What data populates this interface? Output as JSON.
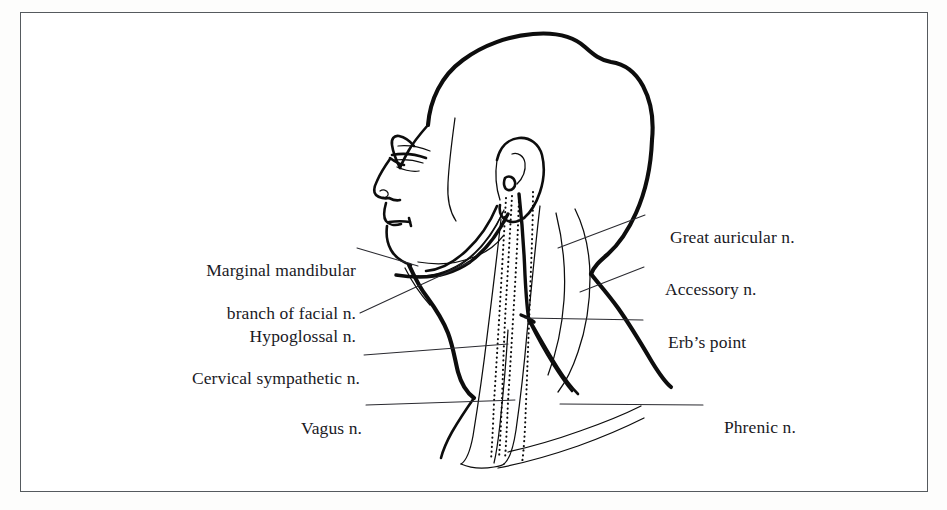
{
  "figure": {
    "frame_border_color": "#555a5e",
    "ink_color": "#0d0d0d",
    "background_color": "#ffffff"
  },
  "labels": {
    "left": [
      {
        "id": "marginal-mandibular",
        "line1": "Marginal mandibular",
        "line2": "branch of facial n.",
        "text": "Marginal mandibular branch of facial n."
      },
      {
        "id": "hypoglossal",
        "line1": "Hypoglossal n.",
        "text": "Hypoglossal n."
      },
      {
        "id": "cervical-sympathetic",
        "line1": "Cervical sympathetic n.",
        "text": "Cervical sympathetic n."
      },
      {
        "id": "vagus",
        "line1": "Vagus n.",
        "text": "Vagus n."
      }
    ],
    "right": [
      {
        "id": "great-auricular",
        "line1": "Great auricular n.",
        "text": "Great auricular n."
      },
      {
        "id": "accessory",
        "line1": "Accessory n.",
        "text": "Accessory n."
      },
      {
        "id": "erbs-point",
        "line1": "Erb’s point",
        "text": "Erb’s point"
      },
      {
        "id": "phrenic",
        "line1": "Phrenic n.",
        "text": "Phrenic n."
      }
    ]
  }
}
